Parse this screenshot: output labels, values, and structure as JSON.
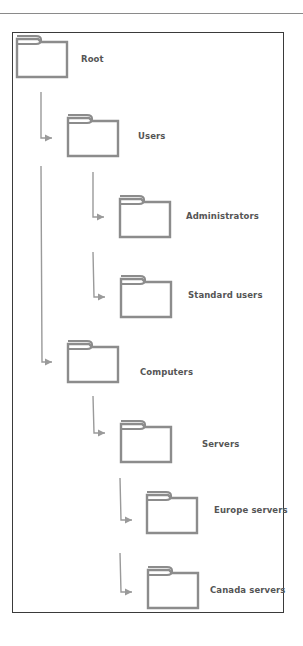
{
  "diagram": {
    "type": "folder-hierarchy",
    "colors": {
      "folder_stroke": "#8c8c8c",
      "connector": "#9a9a9a",
      "frame": "#3a3a3a",
      "label": "#555555"
    },
    "nodes": [
      {
        "id": "root",
        "label": "Root",
        "level": 0,
        "parent": null
      },
      {
        "id": "users",
        "label": "Users",
        "level": 1,
        "parent": "root"
      },
      {
        "id": "administrators",
        "label": "Administrators",
        "level": 2,
        "parent": "users"
      },
      {
        "id": "standard-users",
        "label": "Standard users",
        "level": 2,
        "parent": "users"
      },
      {
        "id": "computers",
        "label": "Computers",
        "level": 1,
        "parent": "root"
      },
      {
        "id": "servers",
        "label": "Servers",
        "level": 2,
        "parent": "computers"
      },
      {
        "id": "europe-servers",
        "label": "Europe servers",
        "level": 3,
        "parent": "servers"
      },
      {
        "id": "canada-servers",
        "label": "Canada servers",
        "level": 3,
        "parent": "servers"
      }
    ]
  }
}
